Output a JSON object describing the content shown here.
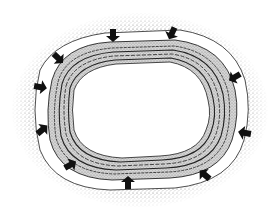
{
  "diagram": {
    "type": "cross-section illustration",
    "colors": {
      "background": "#ffffff",
      "outer_stipple": "#7a7a7a",
      "band": "#ffffff",
      "layer_fill": "#b8b8b8",
      "layer_lines": "#2a2a2a",
      "arrow": "#111111",
      "lumen": "#ffffff"
    },
    "layers": [
      {
        "name": "outer-stippled-zone"
      },
      {
        "name": "clear-band"
      },
      {
        "name": "wavy-layered-wall"
      },
      {
        "name": "inner-lumen"
      }
    ],
    "arrows": [
      {
        "x": 113,
        "y": 35,
        "angle": 90
      },
      {
        "x": 172,
        "y": 33,
        "angle": 115
      },
      {
        "x": 58,
        "y": 58,
        "angle": 45
      },
      {
        "x": 40,
        "y": 87,
        "angle": 10
      },
      {
        "x": 42,
        "y": 130,
        "angle": -40
      },
      {
        "x": 70,
        "y": 165,
        "angle": -30
      },
      {
        "x": 128,
        "y": 183,
        "angle": -90
      },
      {
        "x": 205,
        "y": 175,
        "angle": -140
      },
      {
        "x": 235,
        "y": 77,
        "angle": 150
      },
      {
        "x": 245,
        "y": 133,
        "angle": 190
      }
    ]
  }
}
